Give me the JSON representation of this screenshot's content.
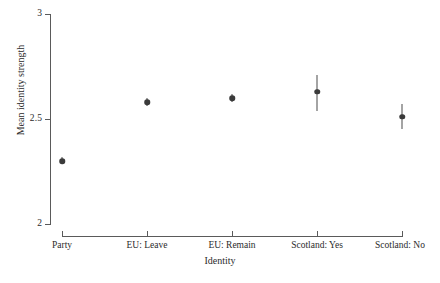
{
  "chart_data": {
    "type": "scatter",
    "title": "",
    "xlabel": "Identity",
    "ylabel": "Mean identity strength",
    "categories": [
      "Party",
      "EU: Leave",
      "EU: Remain",
      "Scotland: Yes",
      "Scotland: No"
    ],
    "values": [
      2.3,
      2.58,
      2.6,
      2.63,
      2.51
    ],
    "errors_low": [
      2.29,
      2.56,
      2.58,
      2.54,
      2.45
    ],
    "errors_high": [
      2.32,
      2.6,
      2.62,
      2.71,
      2.57
    ],
    "ylim": [
      2,
      3
    ],
    "yticks": [
      2,
      2.5,
      3
    ],
    "ytick_labels": [
      "2",
      "2.5",
      "3"
    ],
    "grid": false,
    "legend": "none",
    "marker": "filled-circle",
    "series": [
      {
        "name": "Mean identity strength",
        "points": [
          {
            "category": "Party",
            "value": 2.3,
            "ci_low": 2.29,
            "ci_high": 2.32
          },
          {
            "category": "EU: Leave",
            "value": 2.58,
            "ci_low": 2.56,
            "ci_high": 2.6
          },
          {
            "category": "EU: Remain",
            "value": 2.6,
            "ci_low": 2.58,
            "ci_high": 2.62
          },
          {
            "category": "Scotland: Yes",
            "value": 2.63,
            "ci_low": 2.54,
            "ci_high": 2.71
          },
          {
            "category": "Scotland: No",
            "value": 2.51,
            "ci_low": 2.45,
            "ci_high": 2.57
          }
        ]
      }
    ],
    "colors": {
      "marker": "#3a3a3a",
      "axis": "#5a5a5a",
      "text": "#2b2b2b",
      "background": "#ffffff"
    }
  }
}
